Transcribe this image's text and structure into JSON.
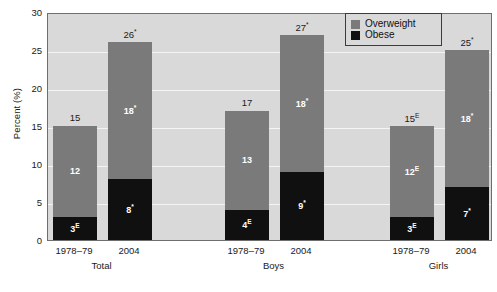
{
  "chart_data": {
    "type": "bar",
    "title": "",
    "xlabel": "",
    "ylabel": "Percent (%)",
    "ylim": [
      0,
      30
    ],
    "yticks": [
      0,
      5,
      10,
      15,
      20,
      25,
      30
    ],
    "ytick_labels": [
      "0",
      "5",
      "10",
      "15",
      "20",
      "25",
      "30"
    ],
    "grid": true,
    "stacked": true,
    "legend_position": "top-right",
    "categories": [
      "1978–79",
      "2004",
      "1978–79",
      "2004",
      "1978–79",
      "2004"
    ],
    "groups": [
      "Total",
      "Boys",
      "Girls"
    ],
    "series": [
      {
        "name": "Obese",
        "values": [
          3,
          8,
          4,
          9,
          3,
          7
        ]
      },
      {
        "name": "Overweight",
        "values": [
          12,
          18,
          13,
          18,
          12,
          18
        ]
      }
    ],
    "bars": [
      {
        "group": "Total",
        "period": "1978–79",
        "obese_value": 3,
        "obese_label": "3",
        "obese_sup": "E",
        "overweight_value": 12,
        "overweight_label": "12",
        "overweight_sup": "",
        "total_value": 15,
        "total_label": "15",
        "total_sup": ""
      },
      {
        "group": "Total",
        "period": "2004",
        "obese_value": 8,
        "obese_label": "8",
        "obese_sup": "*",
        "overweight_value": 18,
        "overweight_label": "18",
        "overweight_sup": "*",
        "total_value": 26,
        "total_label": "26",
        "total_sup": "*"
      },
      {
        "group": "Boys",
        "period": "1978–79",
        "obese_value": 4,
        "obese_label": "4",
        "obese_sup": "E",
        "overweight_value": 13,
        "overweight_label": "13",
        "overweight_sup": "",
        "total_value": 17,
        "total_label": "17",
        "total_sup": ""
      },
      {
        "group": "Boys",
        "period": "2004",
        "obese_value": 9,
        "obese_label": "9",
        "obese_sup": "*",
        "overweight_value": 18,
        "overweight_label": "18",
        "overweight_sup": "*",
        "total_value": 27,
        "total_label": "27",
        "total_sup": "*"
      },
      {
        "group": "Girls",
        "period": "1978–79",
        "obese_value": 3,
        "obese_label": "3",
        "obese_sup": "E",
        "overweight_value": 12,
        "overweight_label": "12",
        "overweight_sup": "E",
        "total_value": 15,
        "total_label": "15",
        "total_sup": "E"
      },
      {
        "group": "Girls",
        "period": "2004",
        "obese_value": 7,
        "obese_label": "7",
        "obese_sup": "*",
        "overweight_value": 18,
        "overweight_label": "18",
        "overweight_sup": "*",
        "total_value": 25,
        "total_label": "25",
        "total_sup": "*"
      }
    ],
    "legend": [
      {
        "label": "Overweight",
        "color": "#7a7a7a",
        "swatch": "overweight-swatch"
      },
      {
        "label": "Obese",
        "color": "#101010",
        "swatch": "obese-swatch"
      }
    ],
    "colors": {
      "overweight": "#7a7a7a",
      "obese": "#101010",
      "plot_background": "#d9d9d9",
      "gridline": "#f4f4f4",
      "axis": "#6e6e6e",
      "text": "#1a1a1a"
    }
  },
  "axis": {
    "y_title": "Percent (%)"
  },
  "footnote": {
    "text": ""
  }
}
